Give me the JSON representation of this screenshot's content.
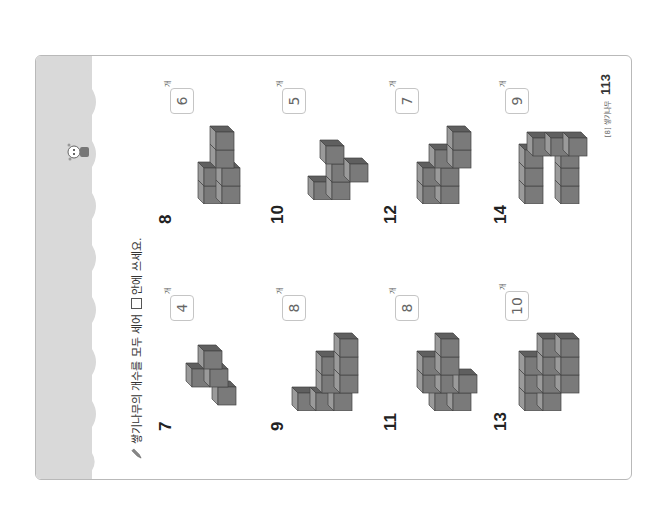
{
  "page": {
    "instruction": "쌓기나무의 개수를 모두 세어",
    "instruction_after": "안에 쓰세요.",
    "icon": "pencil-icon",
    "band_color": "#d9d9d9",
    "cube_color": "#7a7a7a"
  },
  "problems": [
    {
      "number": "7",
      "answer": "4",
      "unit": "개"
    },
    {
      "number": "8",
      "answer": "6",
      "unit": "개"
    },
    {
      "number": "9",
      "answer": "8",
      "unit": "개"
    },
    {
      "number": "10",
      "answer": "5",
      "unit": "개"
    },
    {
      "number": "11",
      "answer": "8",
      "unit": "개"
    },
    {
      "number": "12",
      "answer": "7",
      "unit": "개"
    },
    {
      "number": "13",
      "answer": "10",
      "unit": "개"
    },
    {
      "number": "14",
      "answer": "9",
      "unit": "개"
    }
  ],
  "footer": {
    "chapter": "[8] 쌓기나무",
    "page_number": "113"
  }
}
